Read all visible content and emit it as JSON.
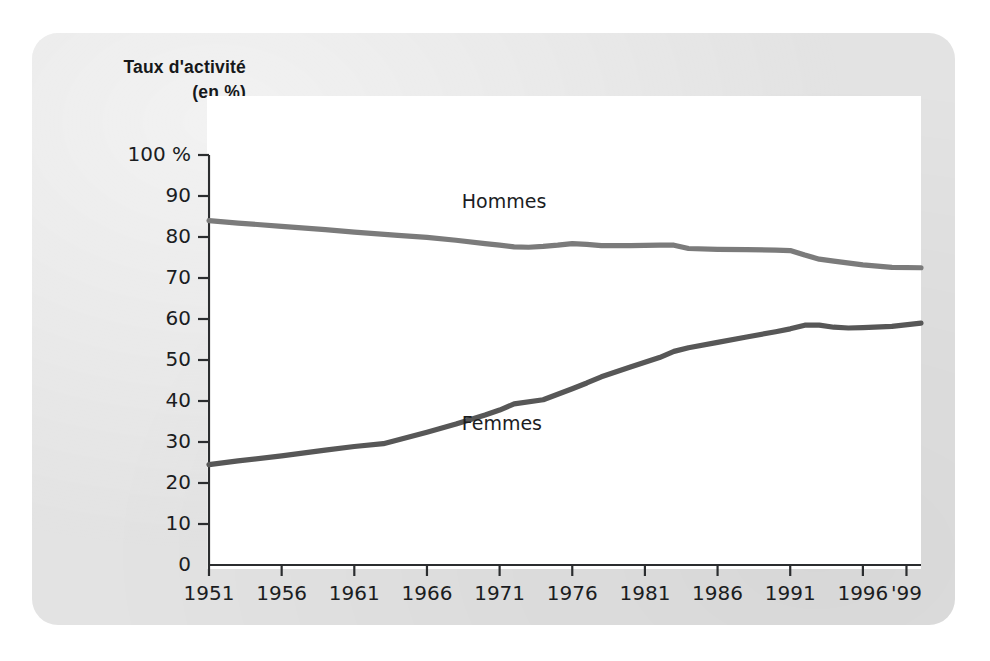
{
  "figure": {
    "title_line1": "Taux d'activité",
    "title_line2": "(en %)",
    "panel_color": "#e3e3e3",
    "plot_background": "#ffffff"
  },
  "chart_data": {
    "type": "line",
    "title": "Taux d'activité (en %)",
    "xlabel": "",
    "ylabel": "Taux d'activité (en %)",
    "ylim": [
      0,
      100
    ],
    "xlim": [
      1951,
      2000
    ],
    "grid": false,
    "legend": "inline-labels",
    "ytick_labels": [
      "0",
      "10",
      "20",
      "30",
      "40",
      "50",
      "60",
      "70",
      "80",
      "90",
      "100 %"
    ],
    "ytick_values": [
      0,
      10,
      20,
      30,
      40,
      50,
      60,
      70,
      80,
      90,
      100
    ],
    "xtick_labels": [
      "1951",
      "1956",
      "1961",
      "1966",
      "1971",
      "1976",
      "1981",
      "1986",
      "1991",
      "1996",
      "'99"
    ],
    "xtick_values": [
      1951,
      1956,
      1961,
      1966,
      1971,
      1976,
      1981,
      1986,
      1991,
      1996,
      1999
    ],
    "series": [
      {
        "name": "Hommes",
        "color": "#7b7b7b",
        "label_x": 1968.4,
        "label_y": 88.5,
        "x": [
          1951,
          1953,
          1956,
          1959,
          1961,
          1964,
          1966,
          1968,
          1970,
          1971,
          1972,
          1973,
          1974,
          1975,
          1976,
          1977,
          1978,
          1980,
          1982,
          1983,
          1984,
          1986,
          1988,
          1990,
          1991,
          1992,
          1993,
          1994,
          1996,
          1998,
          2000
        ],
        "values": [
          84.0,
          83.4,
          82.6,
          81.8,
          81.2,
          80.4,
          79.9,
          79.2,
          78.4,
          78.0,
          77.6,
          77.5,
          77.7,
          78.0,
          78.4,
          78.2,
          77.9,
          77.9,
          78.0,
          78.0,
          77.2,
          77.0,
          76.9,
          76.8,
          76.7,
          75.6,
          74.6,
          74.1,
          73.2,
          72.6,
          72.5
        ]
      },
      {
        "name": "Femmes",
        "color": "#575757",
        "label_x": 1968.4,
        "label_y": 34.5,
        "x": [
          1951,
          1953,
          1956,
          1959,
          1961,
          1963,
          1966,
          1968,
          1970,
          1971,
          1972,
          1974,
          1976,
          1977,
          1978,
          1980,
          1982,
          1983,
          1984,
          1986,
          1988,
          1990,
          1991,
          1992,
          1993,
          1994,
          1995,
          1996,
          1998,
          2000
        ],
        "values": [
          24.5,
          25.4,
          26.6,
          28.0,
          28.9,
          29.6,
          32.4,
          34.4,
          36.6,
          37.8,
          39.3,
          40.3,
          43.0,
          44.4,
          45.9,
          48.3,
          50.6,
          52.1,
          53.0,
          54.3,
          55.6,
          56.9,
          57.6,
          58.5,
          58.5,
          58.0,
          57.8,
          57.9,
          58.2,
          59.0
        ]
      }
    ]
  }
}
